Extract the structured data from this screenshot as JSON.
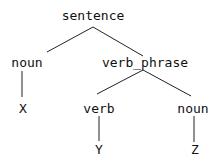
{
  "tree": {
    "root": "sentence",
    "nodes": [
      {
        "id": "sentence",
        "label": "sentence",
        "x": 93,
        "y": 9
      },
      {
        "id": "noun1",
        "label": "noun",
        "x": 25,
        "y": 56
      },
      {
        "id": "verb_phrase",
        "label": "verb_phrase",
        "x": 145,
        "y": 56
      },
      {
        "id": "X",
        "label": "X",
        "x": 23,
        "y": 102
      },
      {
        "id": "verb",
        "label": "verb",
        "x": 99,
        "y": 102
      },
      {
        "id": "noun2",
        "label": "noun",
        "x": 193,
        "y": 102
      },
      {
        "id": "Y",
        "label": "Y",
        "x": 99,
        "y": 143
      },
      {
        "id": "Z",
        "label": "Z",
        "x": 195,
        "y": 143
      }
    ],
    "edges": [
      [
        "sentence",
        "noun1"
      ],
      [
        "sentence",
        "verb_phrase"
      ],
      [
        "noun1",
        "X"
      ],
      [
        "verb_phrase",
        "verb"
      ],
      [
        "verb_phrase",
        "noun2"
      ],
      [
        "verb",
        "Y"
      ],
      [
        "noun2",
        "Z"
      ]
    ]
  }
}
